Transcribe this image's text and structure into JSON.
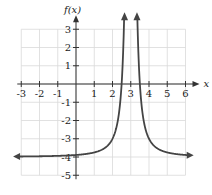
{
  "chart_data": {
    "type": "line",
    "title": "",
    "xlabel": "x",
    "ylabel": "f(x)",
    "xlim": [
      -3,
      6
    ],
    "ylim": [
      -5,
      3
    ],
    "grid": true,
    "x_ticks": [
      "-3",
      "-2",
      "-1",
      "1",
      "2",
      "3",
      "4",
      "5",
      "6"
    ],
    "y_ticks": [
      "3",
      "2",
      "1",
      "-1",
      "-2",
      "-3",
      "-4",
      "-5"
    ],
    "function": "f(x) = 1/(x-3)^2 - 4",
    "vertical_asymptote": 3,
    "horizontal_asymptote": -4,
    "series": [
      {
        "name": "f(x)",
        "color": "#444444",
        "points_left": [
          [
            -3.2,
            -3.97
          ],
          [
            -1,
            -3.94
          ],
          [
            0,
            -3.89
          ],
          [
            1,
            -3.75
          ],
          [
            1.5,
            -3.56
          ],
          [
            2,
            -3
          ],
          [
            2.3,
            -1.96
          ],
          [
            2.5,
            0
          ],
          [
            2.6,
            2.25
          ],
          [
            2.64,
            3.5
          ]
        ],
        "points_right": [
          [
            3.36,
            3.5
          ],
          [
            3.4,
            2.25
          ],
          [
            3.5,
            0
          ],
          [
            3.7,
            -1.96
          ],
          [
            4,
            -3
          ],
          [
            4.5,
            -3.56
          ],
          [
            5,
            -3.75
          ],
          [
            6,
            -3.89
          ],
          [
            6.2,
            -3.9
          ]
        ]
      }
    ]
  }
}
